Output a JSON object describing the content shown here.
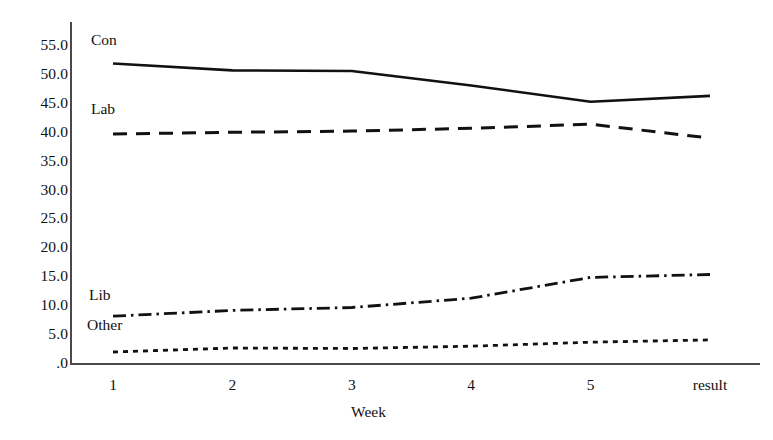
{
  "chart_data": {
    "type": "line",
    "title": "",
    "xlabel": "Week",
    "ylabel": "",
    "x": [
      "1",
      "2",
      "3",
      "4",
      "5",
      "result"
    ],
    "categories": [
      "1",
      "2",
      "3",
      "4",
      "5",
      "result"
    ],
    "xtick_labels": [
      "1",
      "2",
      "3",
      "4",
      "5",
      "result"
    ],
    "ytick_labels": [
      "55.0",
      "50.0",
      "45.0",
      "40.0",
      "35.0",
      "30.0",
      "25.0",
      "20.0",
      "15.0",
      "10.0",
      "5.0",
      ".0"
    ],
    "ytick_values": [
      55,
      50,
      45,
      40,
      35,
      30,
      25,
      20,
      15,
      10,
      5,
      0
    ],
    "ylim": [
      0,
      55
    ],
    "grid": false,
    "legend_position": "inline-left",
    "series": [
      {
        "name": "Con",
        "style": "solid",
        "color": "#111111",
        "values": [
          51.8,
          50.6,
          50.5,
          48.0,
          45.2,
          46.2
        ]
      },
      {
        "name": "Lab",
        "style": "dashed",
        "color": "#111111",
        "values": [
          39.6,
          39.9,
          40.1,
          40.6,
          41.3,
          38.9
        ]
      },
      {
        "name": "Lib",
        "style": "dash-dot",
        "color": "#111111",
        "values": [
          8.1,
          9.1,
          9.6,
          11.2,
          14.8,
          15.3
        ]
      },
      {
        "name": "Other",
        "style": "dotted",
        "color": "#111111",
        "values": [
          1.9,
          2.6,
          2.5,
          2.9,
          3.6,
          4.0
        ]
      }
    ],
    "series_label_positions": [
      {
        "name": "Con",
        "left": 91,
        "top": 32
      },
      {
        "name": "Lab",
        "left": 91,
        "top": 101
      },
      {
        "name": "Lib",
        "left": 89,
        "top": 287
      },
      {
        "name": "Other",
        "left": 87,
        "top": 317
      }
    ]
  },
  "axis": {
    "x_title": "Week"
  }
}
